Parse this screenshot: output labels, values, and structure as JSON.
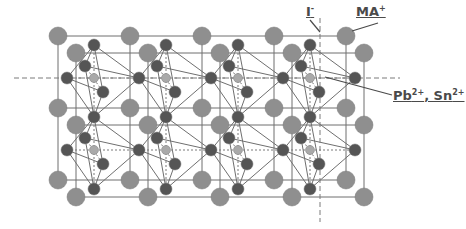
{
  "diagram": {
    "labels": {
      "iodide": {
        "text": "I",
        "charge": "-"
      },
      "cation": {
        "text": "MA",
        "charge": "+"
      },
      "metal": {
        "parts": [
          {
            "text": "Pb",
            "charge": "2+"
          },
          {
            "text": ", Sn",
            "charge": "2+"
          }
        ]
      }
    },
    "lattice": {
      "cells_x": 4,
      "cells_y": 2
    },
    "colors": {
      "large_sphere": "#8f8f8f",
      "metal_atom": "#555555",
      "small_atom": "#a9a9a9",
      "line": "#6f6f6f",
      "dashed": "#7a7a7a",
      "label": "#4a4a4a"
    }
  }
}
